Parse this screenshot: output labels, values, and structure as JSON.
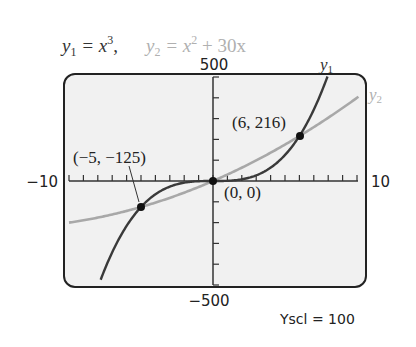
{
  "chart_data": {
    "type": "line",
    "title_parts": {
      "y1": {
        "var": "y",
        "sub": "1",
        "eq": " = x",
        "sup": "3",
        "tail": ","
      },
      "y2": {
        "var": "y",
        "sub": "2",
        "eq": " = x",
        "sup": "2",
        "tail": " + 30x"
      }
    },
    "xlim": [
      -10,
      10
    ],
    "ylim": [
      -500,
      500
    ],
    "xscl": 1,
    "yscl": 100,
    "grid": false,
    "axis_labels": {
      "xmin": "−10",
      "xmax": "10",
      "ymax": "500",
      "ymin": "−500",
      "yscl": "Yscl = 100"
    },
    "series": [
      {
        "name": "y1",
        "label_var": "y",
        "label_sub": "1",
        "expression": "x^3",
        "color": "#3a3a3a"
      },
      {
        "name": "y2",
        "label_var": "y",
        "label_sub": "2",
        "expression": "x^2 + 30x",
        "color": "#a8a8a8"
      }
    ],
    "intersections": [
      {
        "x": -5,
        "y": -125,
        "label": "(−5, −125)"
      },
      {
        "x": 0,
        "y": 0,
        "label": "(0, 0)"
      },
      {
        "x": 6,
        "y": 216,
        "label": "(6, 216)"
      }
    ]
  }
}
